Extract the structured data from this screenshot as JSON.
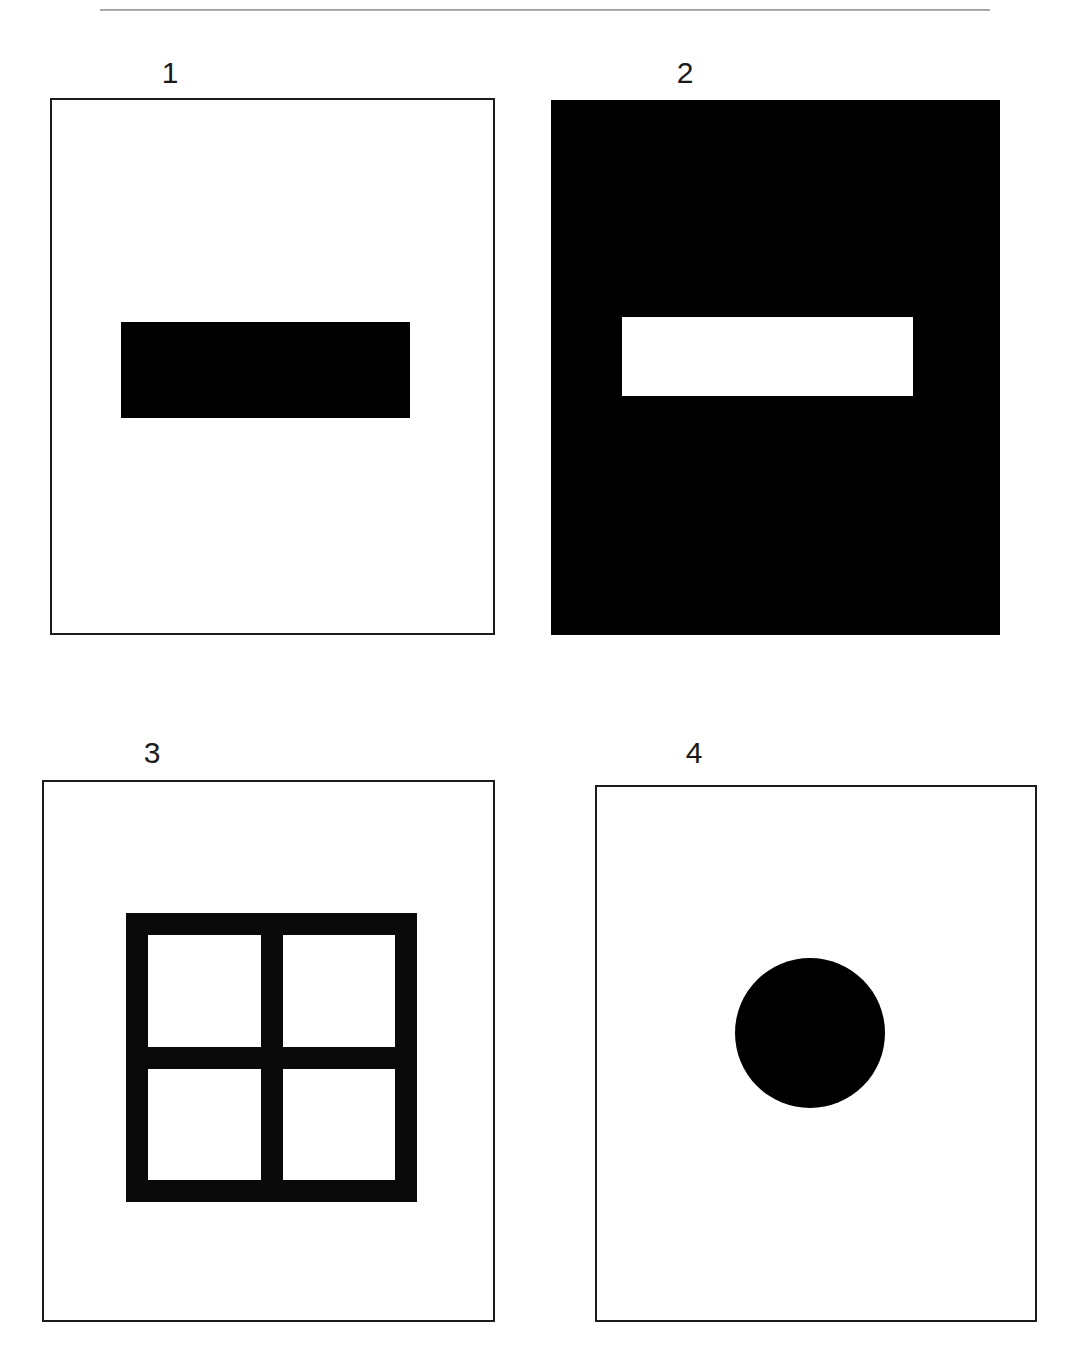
{
  "figure": {
    "rule": {
      "name": "horizontal-rule",
      "color": "#8e8e8e"
    },
    "background": "#ffffff",
    "ink": "#000000",
    "panels": [
      {
        "label": "1",
        "style": "outlined",
        "background": "#ffffff",
        "border_color": "#1c1c1c",
        "shape": "filled-horizontal-bar",
        "shape_color": "#000000",
        "description": "black horizontal rectangle centered on white field"
      },
      {
        "label": "2",
        "style": "solid",
        "background": "#000000",
        "border_color": "#000000",
        "shape": "hollow-horizontal-bar",
        "shape_color": "#ffffff",
        "description": "white horizontal rectangle centered on black field"
      },
      {
        "label": "3",
        "style": "outlined",
        "background": "#ffffff",
        "border_color": "#1c1c1c",
        "shape": "four-pane-grid",
        "shape_color": "#0a0a0a",
        "description": "thick black square frame divided into four white panes"
      },
      {
        "label": "4",
        "style": "outlined",
        "background": "#ffffff",
        "border_color": "#1c1c1c",
        "shape": "filled-circle",
        "shape_color": "#000000",
        "description": "solid black circle centered on white field"
      }
    ],
    "grid_panes": [
      "",
      "",
      "",
      ""
    ]
  }
}
